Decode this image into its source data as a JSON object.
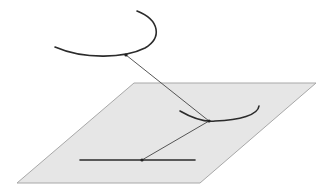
{
  "diagram": {
    "colors": {
      "background": "#ffffff",
      "plane_fill": "#e6e6e6",
      "plane_stroke": "#a8a8a8",
      "curve_stroke": "#2b2b2b",
      "projection_line": "#444444",
      "point_fill": "#222222"
    },
    "plane": {
      "shape": "parallelogram",
      "corners": [
        [
          134,
          83
        ],
        [
          316,
          83
        ],
        [
          200,
          183
        ],
        [
          17,
          183
        ]
      ]
    },
    "upper_arc": {
      "start": [
        55,
        47
      ],
      "end": [
        137,
        11
      ],
      "marked_point": [
        126,
        55
      ]
    },
    "lower_arc": {
      "start": [
        180,
        111
      ],
      "end": [
        259,
        107
      ],
      "marked_point": [
        209,
        121
      ]
    },
    "plane_line": {
      "start": [
        80,
        160
      ],
      "end": [
        195,
        160
      ],
      "marked_point": [
        142,
        160
      ]
    },
    "connectors": [
      {
        "from": [
          126,
          55
        ],
        "to": [
          209,
          121
        ]
      },
      {
        "from": [
          209,
          121
        ],
        "to": [
          142,
          160
        ]
      }
    ]
  }
}
